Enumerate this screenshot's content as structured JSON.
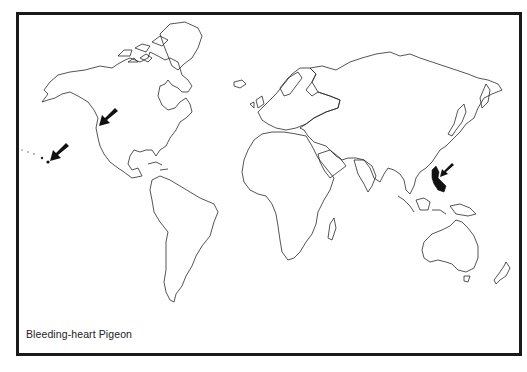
{
  "map": {
    "type": "world-outline-distribution-map",
    "caption": "Bleeding-heart Pigeon",
    "colors": {
      "frame": "#1a1a1a",
      "coastline": "#2a2a2a",
      "range": "#111111",
      "background": "#ffffff"
    },
    "markers": [
      {
        "name": "hawaii-arrow",
        "points_to": "Hawaiian Islands"
      },
      {
        "name": "california-arrow",
        "points_to": "California coast"
      },
      {
        "name": "philippines-arrow",
        "points_to": "Philippines (native range, filled)"
      }
    ]
  }
}
